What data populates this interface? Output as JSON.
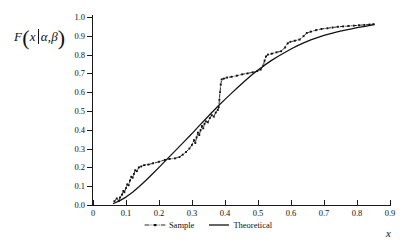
{
  "chart_data": {
    "type": "line",
    "title": "",
    "subtitle": "",
    "xlabel": "x",
    "ylabel": "F(x|α,β)",
    "ylabel_parts": {
      "fn": "F",
      "var": "x",
      "sep": "|",
      "alpha": "α",
      "comma": ",",
      "beta": "β"
    },
    "xlim": [
      0,
      0.9
    ],
    "ylim": [
      0,
      1.0
    ],
    "xticks": [
      0,
      0.1,
      0.2,
      0.3,
      0.4,
      0.5,
      0.6,
      0.7,
      0.8,
      0.9
    ],
    "xticklabels": [
      "0",
      "0.1",
      "0.2",
      "0.3",
      "0.4",
      "0.5",
      "0.6",
      "0.7",
      "0.8",
      "0.9"
    ],
    "yticks": [
      0.0,
      0.1,
      0.2,
      0.3,
      0.4,
      0.5,
      0.6,
      0.7,
      0.8,
      0.9,
      1.0
    ],
    "yticklabels": [
      "0.0",
      "0.1",
      "0.2",
      "0.3",
      "0.4",
      "0.5",
      "0.6",
      "0.7",
      "0.8",
      "0.9",
      "1.0"
    ],
    "grid": false,
    "legend_position": "below-center",
    "series": [
      {
        "name": "Sample",
        "style": "dash-dot",
        "marker": "square",
        "color": "#111111",
        "points": [
          [
            0.065,
            0.02
          ],
          [
            0.072,
            0.035
          ],
          [
            0.078,
            0.022
          ],
          [
            0.082,
            0.04
          ],
          [
            0.088,
            0.055
          ],
          [
            0.092,
            0.075
          ],
          [
            0.095,
            0.068
          ],
          [
            0.1,
            0.09
          ],
          [
            0.104,
            0.11
          ],
          [
            0.108,
            0.105
          ],
          [
            0.112,
            0.13
          ],
          [
            0.116,
            0.15
          ],
          [
            0.12,
            0.145
          ],
          [
            0.124,
            0.165
          ],
          [
            0.128,
            0.185
          ],
          [
            0.133,
            0.18
          ],
          [
            0.139,
            0.2
          ],
          [
            0.146,
            0.205
          ],
          [
            0.155,
            0.212
          ],
          [
            0.168,
            0.215
          ],
          [
            0.182,
            0.222
          ],
          [
            0.2,
            0.23
          ],
          [
            0.218,
            0.24
          ],
          [
            0.232,
            0.245
          ],
          [
            0.248,
            0.248
          ],
          [
            0.262,
            0.255
          ],
          [
            0.272,
            0.268
          ],
          [
            0.282,
            0.282
          ],
          [
            0.292,
            0.3
          ],
          [
            0.3,
            0.32
          ],
          [
            0.306,
            0.345
          ],
          [
            0.31,
            0.33
          ],
          [
            0.314,
            0.36
          ],
          [
            0.318,
            0.385
          ],
          [
            0.322,
            0.372
          ],
          [
            0.326,
            0.398
          ],
          [
            0.33,
            0.42
          ],
          [
            0.334,
            0.408
          ],
          [
            0.338,
            0.432
          ],
          [
            0.342,
            0.445
          ],
          [
            0.348,
            0.44
          ],
          [
            0.354,
            0.462
          ],
          [
            0.36,
            0.478
          ],
          [
            0.366,
            0.47
          ],
          [
            0.372,
            0.492
          ],
          [
            0.378,
            0.505
          ],
          [
            0.381,
            0.52
          ],
          [
            0.383,
            0.56
          ],
          [
            0.385,
            0.6
          ],
          [
            0.387,
            0.64
          ],
          [
            0.39,
            0.668
          ],
          [
            0.396,
            0.672
          ],
          [
            0.406,
            0.678
          ],
          [
            0.42,
            0.682
          ],
          [
            0.436,
            0.688
          ],
          [
            0.452,
            0.695
          ],
          [
            0.468,
            0.7
          ],
          [
            0.484,
            0.706
          ],
          [
            0.498,
            0.712
          ],
          [
            0.508,
            0.72
          ],
          [
            0.516,
            0.742
          ],
          [
            0.52,
            0.768
          ],
          [
            0.524,
            0.79
          ],
          [
            0.53,
            0.8
          ],
          [
            0.542,
            0.805
          ],
          [
            0.556,
            0.812
          ],
          [
            0.57,
            0.818
          ],
          [
            0.582,
            0.838
          ],
          [
            0.59,
            0.86
          ],
          [
            0.598,
            0.868
          ],
          [
            0.612,
            0.874
          ],
          [
            0.626,
            0.88
          ],
          [
            0.638,
            0.898
          ],
          [
            0.648,
            0.915
          ],
          [
            0.66,
            0.922
          ],
          [
            0.676,
            0.93
          ],
          [
            0.692,
            0.936
          ],
          [
            0.71,
            0.94
          ],
          [
            0.726,
            0.944
          ],
          [
            0.742,
            0.948
          ],
          [
            0.758,
            0.95
          ],
          [
            0.774,
            0.952
          ],
          [
            0.79,
            0.954
          ],
          [
            0.806,
            0.956
          ],
          [
            0.822,
            0.958
          ],
          [
            0.838,
            0.96
          ],
          [
            0.85,
            0.962
          ]
        ]
      },
      {
        "name": "Theoretical",
        "style": "solid",
        "marker": "none",
        "color": "#111111",
        "points": [
          [
            0.062,
            0.008
          ],
          [
            0.08,
            0.022
          ],
          [
            0.1,
            0.042
          ],
          [
            0.12,
            0.068
          ],
          [
            0.14,
            0.098
          ],
          [
            0.16,
            0.13
          ],
          [
            0.18,
            0.165
          ],
          [
            0.2,
            0.2
          ],
          [
            0.22,
            0.236
          ],
          [
            0.24,
            0.272
          ],
          [
            0.26,
            0.308
          ],
          [
            0.28,
            0.344
          ],
          [
            0.3,
            0.38
          ],
          [
            0.32,
            0.418
          ],
          [
            0.34,
            0.455
          ],
          [
            0.36,
            0.492
          ],
          [
            0.38,
            0.528
          ],
          [
            0.4,
            0.562
          ],
          [
            0.42,
            0.595
          ],
          [
            0.44,
            0.628
          ],
          [
            0.46,
            0.66
          ],
          [
            0.48,
            0.69
          ],
          [
            0.5,
            0.718
          ],
          [
            0.52,
            0.744
          ],
          [
            0.54,
            0.768
          ],
          [
            0.56,
            0.79
          ],
          [
            0.58,
            0.81
          ],
          [
            0.6,
            0.83
          ],
          [
            0.62,
            0.848
          ],
          [
            0.64,
            0.864
          ],
          [
            0.66,
            0.878
          ],
          [
            0.68,
            0.89
          ],
          [
            0.7,
            0.902
          ],
          [
            0.72,
            0.912
          ],
          [
            0.74,
            0.921
          ],
          [
            0.76,
            0.929
          ],
          [
            0.78,
            0.936
          ],
          [
            0.8,
            0.943
          ],
          [
            0.82,
            0.949
          ],
          [
            0.84,
            0.955
          ],
          [
            0.852,
            0.96
          ]
        ]
      }
    ],
    "legend": [
      {
        "label": "Sample",
        "style": "dash-dot-marker"
      },
      {
        "label": "Theoretical",
        "style": "solid"
      }
    ]
  }
}
